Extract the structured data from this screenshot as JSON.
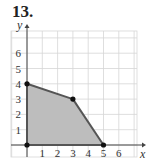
{
  "problem_label": "13.",
  "chart_data": {
    "type": "area",
    "title": "13.",
    "xlabel": "x",
    "ylabel": "y",
    "xlim": [
      -1,
      7
    ],
    "ylim": [
      -0.5,
      7
    ],
    "grid": true,
    "x_ticks": [
      "1",
      "2",
      "3",
      "4",
      "5",
      "6"
    ],
    "y_ticks": [
      "1",
      "2",
      "3",
      "4",
      "5",
      "6"
    ],
    "polygon_vertices": [
      [
        0,
        0
      ],
      [
        0,
        4
      ],
      [
        3,
        3
      ],
      [
        5,
        0
      ]
    ],
    "shaded_region": "feasible region bounded by (0,0),(0,4),(3,3),(5,0)",
    "fill_color": "#bdbdbd",
    "edge_color": "#555555"
  }
}
